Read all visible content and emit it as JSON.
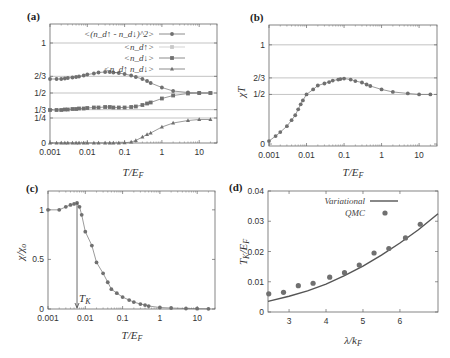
{
  "figure": {
    "panels": [
      {
        "id": "a",
        "label": "(a)"
      },
      {
        "id": "b",
        "label": "(b)"
      },
      {
        "id": "c",
        "label": "(c)"
      },
      {
        "id": "d",
        "label": "(d)"
      }
    ]
  },
  "chart_data": [
    {
      "panel": "(a)",
      "type": "line",
      "xscale": "log",
      "xlabel": "T/E_F",
      "ylabel": "",
      "xlim": [
        0.001,
        30
      ],
      "ylim": [
        0,
        1.25
      ],
      "xticks": [
        "0.001",
        "0.01",
        "0.1",
        "1",
        "10"
      ],
      "yticks": [
        "0",
        "1/4",
        "1/3",
        "1/2",
        "2/3",
        "1"
      ],
      "hlines": [
        1,
        0.6667,
        0.5,
        0.3333,
        0.25
      ],
      "legend": [
        "<(n_d↑ - n_d↓)^2>",
        "<n_d↑>",
        "<n_d↓>",
        "<n_d↑ n_d↓>"
      ],
      "legend_position": "upper right",
      "series": [
        {
          "name": "<(n_d↑ - n_d↓)^2>",
          "marker": "circle",
          "x": [
            0.001,
            0.0015,
            0.002,
            0.0025,
            0.003,
            0.004,
            0.005,
            0.006,
            0.008,
            0.01,
            0.015,
            0.02,
            0.03,
            0.04,
            0.05,
            0.07,
            0.1,
            0.15,
            0.2,
            0.3,
            0.4,
            0.5,
            1,
            2,
            5,
            10,
            20
          ],
          "values": [
            0.64,
            0.64,
            0.64,
            0.645,
            0.65,
            0.655,
            0.66,
            0.665,
            0.675,
            0.685,
            0.695,
            0.705,
            0.71,
            0.71,
            0.705,
            0.7,
            0.69,
            0.675,
            0.66,
            0.64,
            0.62,
            0.6,
            0.555,
            0.52,
            0.505,
            0.5,
            0.5
          ]
        },
        {
          "name": "<n_d↑>",
          "marker": "square-light",
          "x": [
            20
          ],
          "values": [
            0.5
          ]
        },
        {
          "name": "<n_d↓>",
          "marker": "square",
          "x": [
            0.001,
            0.0015,
            0.002,
            0.0025,
            0.003,
            0.004,
            0.005,
            0.006,
            0.008,
            0.01,
            0.015,
            0.02,
            0.03,
            0.04,
            0.05,
            0.07,
            0.1,
            0.15,
            0.2,
            0.3,
            0.4,
            0.5,
            1,
            2,
            5,
            10,
            20
          ],
          "values": [
            0.33,
            0.33,
            0.33,
            0.335,
            0.335,
            0.34,
            0.34,
            0.345,
            0.345,
            0.35,
            0.355,
            0.355,
            0.36,
            0.36,
            0.355,
            0.355,
            0.355,
            0.36,
            0.365,
            0.38,
            0.395,
            0.405,
            0.445,
            0.475,
            0.495,
            0.5,
            0.5
          ]
        },
        {
          "name": "<n_d↑ n_d↓>",
          "marker": "triangle",
          "x": [
            0.001,
            0.0015,
            0.002,
            0.0025,
            0.003,
            0.004,
            0.005,
            0.006,
            0.008,
            0.01,
            0.015,
            0.02,
            0.03,
            0.04,
            0.05,
            0.07,
            0.1,
            0.15,
            0.2,
            0.3,
            0.4,
            0.5,
            1,
            2,
            5,
            10,
            20
          ],
          "values": [
            0,
            0,
            0,
            0,
            0,
            0,
            0,
            0,
            0,
            0,
            0,
            0,
            0,
            0,
            0,
            0,
            0.002,
            0.01,
            0.025,
            0.06,
            0.085,
            0.1,
            0.16,
            0.2,
            0.225,
            0.235,
            0.235
          ]
        }
      ]
    },
    {
      "panel": "(b)",
      "type": "line",
      "xscale": "log",
      "xlabel": "T/E_F",
      "ylabel": "χT",
      "xlim": [
        0.001,
        30
      ],
      "ylim": [
        0,
        1.2
      ],
      "xticks": [
        "0.001",
        "0.01",
        "0.1",
        "1",
        "10"
      ],
      "yticks": [
        "0",
        "1/2",
        "2/3",
        "1"
      ],
      "hlines": [
        1,
        0.6667,
        0.5
      ],
      "series": [
        {
          "name": "χT",
          "marker": "circle",
          "x": [
            0.001,
            0.0015,
            0.002,
            0.003,
            0.004,
            0.005,
            0.006,
            0.007,
            0.008,
            0.01,
            0.015,
            0.02,
            0.03,
            0.04,
            0.05,
            0.07,
            0.08,
            0.1,
            0.15,
            0.2,
            0.3,
            0.4,
            0.5,
            1,
            2,
            5,
            10,
            20
          ],
          "values": [
            0.03,
            0.08,
            0.12,
            0.18,
            0.24,
            0.29,
            0.35,
            0.4,
            0.44,
            0.5,
            0.55,
            0.59,
            0.61,
            0.625,
            0.64,
            0.65,
            0.655,
            0.66,
            0.65,
            0.635,
            0.62,
            0.6,
            0.585,
            0.55,
            0.525,
            0.51,
            0.5,
            0.5
          ]
        }
      ]
    },
    {
      "panel": "(c)",
      "type": "line",
      "xscale": "log",
      "xlabel": "T/E_F",
      "ylabel": "χ/χ_o",
      "xlim": [
        0.001,
        30
      ],
      "ylim": [
        0,
        1.2
      ],
      "xticks": [
        "0.001",
        "0.01",
        "0.1",
        "1",
        "10"
      ],
      "yticks": [
        "0",
        "0.5",
        "1"
      ],
      "annotations": [
        {
          "text": "T_K",
          "x": 0.006,
          "arrow": "vertical line down to x-axis"
        }
      ],
      "series": [
        {
          "name": "χ/χ_o",
          "marker": "circle",
          "x": [
            0.001,
            0.002,
            0.003,
            0.004,
            0.005,
            0.006,
            0.007,
            0.008,
            0.01,
            0.015,
            0.02,
            0.03,
            0.04,
            0.05,
            0.07,
            0.1,
            0.15,
            0.2,
            0.3,
            0.4,
            0.5,
            1,
            2,
            5,
            10,
            20
          ],
          "values": [
            1.0,
            1.0,
            1.03,
            1.05,
            1.06,
            1.07,
            1.03,
            0.95,
            0.78,
            0.64,
            0.47,
            0.36,
            0.27,
            0.2,
            0.16,
            0.12,
            0.09,
            0.07,
            0.05,
            0.04,
            0.03,
            0.015,
            0.01,
            0.005,
            0.003,
            0.002
          ]
        }
      ]
    },
    {
      "panel": "(d)",
      "type": "line",
      "xscale": "linear",
      "xlabel": "λ/k_F",
      "ylabel": "T_K/E_F",
      "xlim": [
        2.43,
        7.03
      ],
      "ylim": [
        0,
        0.04
      ],
      "xticks": [
        "3",
        "4",
        "5",
        "6"
      ],
      "yticks": [
        "0",
        "0.01",
        "0.02",
        "0.03",
        "0.04"
      ],
      "legend": [
        "Variational",
        "QMC"
      ],
      "legend_position": "upper right",
      "series": [
        {
          "name": "Variational",
          "style": "line",
          "x": [
            2.43,
            3.0,
            3.5,
            4.0,
            4.5,
            5.0,
            5.5,
            6.0,
            6.5,
            7.03
          ],
          "values": [
            0.0035,
            0.0052,
            0.007,
            0.0092,
            0.012,
            0.0152,
            0.0188,
            0.0228,
            0.0272,
            0.0325
          ]
        },
        {
          "name": "QMC",
          "style": "markers",
          "x": [
            2.45,
            2.85,
            3.25,
            3.65,
            4.1,
            4.5,
            4.9,
            5.3,
            5.7,
            6.15,
            6.55
          ],
          "values": [
            0.006,
            0.0065,
            0.0087,
            0.0095,
            0.0115,
            0.013,
            0.0155,
            0.0195,
            0.021,
            0.0245,
            0.029
          ]
        }
      ]
    }
  ]
}
